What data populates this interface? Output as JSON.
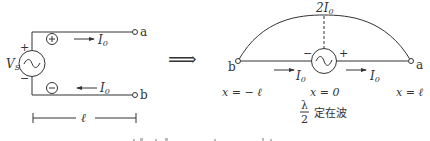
{
  "left_circuit": {
    "source_label": "V",
    "source_sub": "S",
    "plus_sign": "+",
    "minus_sign": "−",
    "top_charge": "⊕",
    "bottom_charge": "⊖",
    "current_top": "I",
    "current_top_sub": "0",
    "current_bottom": "I",
    "current_bottom_sub": "0",
    "terminal_a": "a",
    "terminal_b": "b",
    "length_label": "ℓ"
  },
  "arrow": "⟹",
  "right_antenna": {
    "peak_label": "2I",
    "peak_sub": "0",
    "terminal_b": "b",
    "terminal_a": "a",
    "source_minus": "−",
    "source_plus": "+",
    "current_left": "I",
    "current_left_sub": "0",
    "current_right": "I",
    "current_right_sub": "0",
    "x_left": "x = − ℓ",
    "x_center": "x = 0",
    "x_right": "x = ℓ",
    "fraction_num": "λ",
    "fraction_den": "2",
    "standing_wave_label": "定在波"
  }
}
